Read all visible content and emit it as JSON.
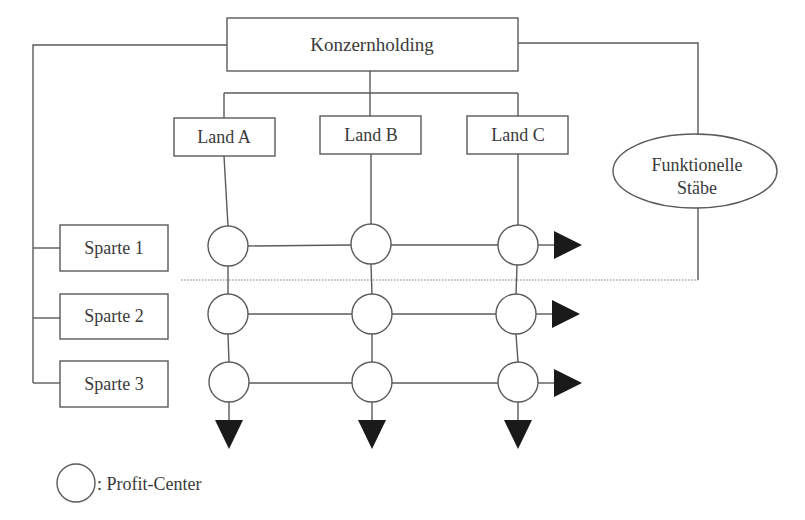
{
  "diagram": {
    "type": "matrix-organization",
    "root": {
      "label": "Konzernholding"
    },
    "countries": [
      {
        "label": "Land A"
      },
      {
        "label": "Land B"
      },
      {
        "label": "Land C"
      }
    ],
    "divisions": [
      {
        "label": "Sparte 1"
      },
      {
        "label": "Sparte 2"
      },
      {
        "label": "Sparte 3"
      }
    ],
    "staff": {
      "line1": "Funktionelle",
      "line2": "Stäbe"
    },
    "legend": {
      "symbol": "circle",
      "text": ": Profit-Center"
    },
    "grid": {
      "rows": 3,
      "cols": 3,
      "node_type": "profit-center"
    },
    "colors": {
      "stroke": "#5a5a5a",
      "arrow_fill": "#1a1a1a",
      "text": "#3a3a3a",
      "background": "#ffffff"
    }
  }
}
